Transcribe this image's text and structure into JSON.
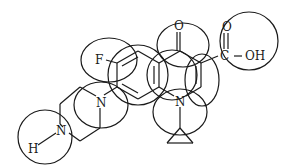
{
  "figure": {
    "type": "chemical-structure",
    "stroke_color": "#1a1a1a",
    "background": "#ffffff"
  },
  "atoms": {
    "fluorine": "F",
    "ketone_oxygen": "O",
    "acid_carbonyl_oxygen": "O",
    "acid_carbon": "C",
    "hydroxyl": "OH",
    "ring_nitrogen": "N",
    "piperazine_nitrogen_1": "N",
    "piperazine_nitrogen_2": "N",
    "amine_hydrogen": "H"
  },
  "circled_fragments": [
    "fluoro-substituent",
    "piperazine-N-attachment",
    "piperazine-NH",
    "benzene-ring-left",
    "ketone",
    "fused-ring-center",
    "alkene-ring",
    "carboxylic-acid",
    "N-cyclopropyl"
  ]
}
